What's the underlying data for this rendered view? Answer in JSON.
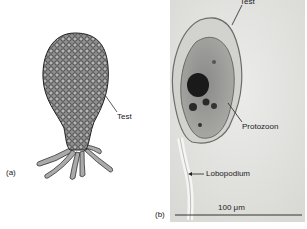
{
  "figure": {
    "panel_a": {
      "letter": "(a)",
      "description": "line drawing of testate amoeba with test and lobopodia",
      "callouts": [
        {
          "label": "Test"
        }
      ]
    },
    "panel_b": {
      "letter": "(b)",
      "description": "light micrograph of testate amoeba",
      "callouts": [
        {
          "label": "Test"
        },
        {
          "label": "Protozoon"
        },
        {
          "label": "Lobopodium"
        }
      ],
      "scale_bar": {
        "label": "100 μm"
      }
    },
    "colors": {
      "photo_background": "#e6e6e4",
      "drawing_fill": "#9a9a9a",
      "drawing_outline": "#333333",
      "dark_inclusion": "#1a1a1a"
    }
  }
}
